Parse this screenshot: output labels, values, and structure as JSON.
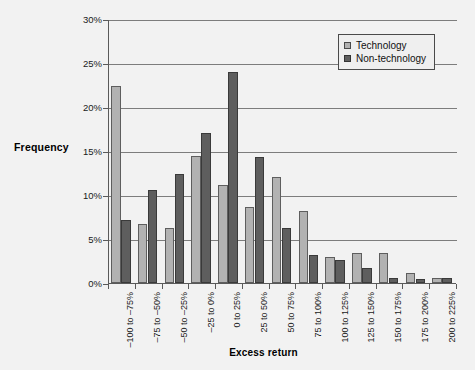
{
  "chart_data": {
    "type": "bar",
    "title": "",
    "xlabel": "Excess return",
    "ylabel": "Frequency",
    "ylim": [
      0,
      30
    ],
    "ytick_labels": [
      "30%",
      "25%",
      "20%",
      "15%",
      "10%",
      "5%",
      "0%"
    ],
    "ytick_values": [
      30,
      25,
      20,
      15,
      10,
      5,
      0
    ],
    "grid": true,
    "legend_position": "top-right",
    "categories": [
      "–100 to –75%",
      "–75 to –50%",
      "–50 to –25%",
      "–25 to 0%",
      "0 to 25%",
      "25 to 50%",
      "50 to 75%",
      "75 to 100%",
      "100 to 125%",
      "125 to 150%",
      "150 to 175%",
      "175 to 200%",
      "200 to 225%"
    ],
    "series": [
      {
        "name": "Technology",
        "color": "#b2b2b2",
        "values": [
          22.4,
          6.7,
          6.2,
          14.4,
          11.1,
          8.6,
          12.0,
          8.2,
          3.0,
          3.4,
          3.4,
          1.1,
          0.6
        ]
      },
      {
        "name": "Non-technology",
        "color": "#5e5e5e",
        "values": [
          7.2,
          10.6,
          12.4,
          17.1,
          24.0,
          14.3,
          6.3,
          3.2,
          2.6,
          1.7,
          0.6,
          0.5,
          0.6
        ]
      }
    ]
  },
  "legend": {
    "items": [
      {
        "label": "Technology",
        "swatch": "light-gray-swatch"
      },
      {
        "label": "Non-technology",
        "swatch": "dark-gray-swatch"
      }
    ]
  },
  "axis": {
    "y_title": "Frequency",
    "x_title": "Excess return"
  }
}
